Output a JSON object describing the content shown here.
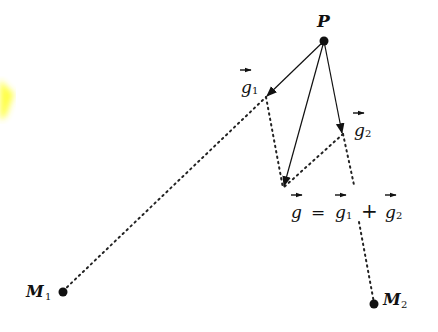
{
  "diagram": {
    "points": {
      "P": {
        "label": "P"
      },
      "M1": {
        "label": "M",
        "sub": "1"
      },
      "M2": {
        "label": "M",
        "sub": "2"
      }
    },
    "vectors": {
      "g1": {
        "label": "g",
        "sub": "1"
      },
      "g2": {
        "label": "g",
        "sub": "2"
      },
      "g": {
        "label": "g"
      }
    },
    "equation": {
      "lhs": "g",
      "equals": "=",
      "term1": "g",
      "term1_sub": "1",
      "plus": "+",
      "term2": "g",
      "term2_sub": "2"
    },
    "colors": {
      "ink": "#111111",
      "highlight": "#ffff33"
    }
  }
}
